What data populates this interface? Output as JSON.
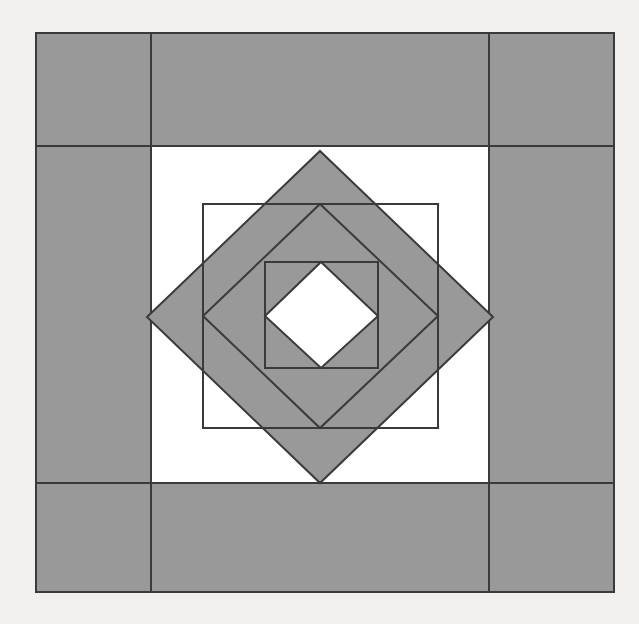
{
  "figure": {
    "canvas": {
      "width": 639,
      "height": 624
    },
    "colors": {
      "background": "#f2f0ee",
      "shape_fill": "#999999",
      "negative_fill": "#ffffff",
      "stroke": "#3a3a3a"
    },
    "stroke_width": 2,
    "frame": {
      "label": "outer border frame",
      "x": 36,
      "y": 33,
      "width": 578,
      "height": 559,
      "inner_x": 151,
      "inner_y": 146,
      "inner_width": 338,
      "inner_height": 337,
      "corner_seam_lines": [
        {
          "name": "top-left-vertical-seam",
          "x1": 151,
          "y1": 33,
          "x2": 151,
          "y2": 146
        },
        {
          "name": "top-right-vertical-seam",
          "x1": 489,
          "y1": 33,
          "x2": 489,
          "y2": 146
        },
        {
          "name": "bottom-left-vertical-seam",
          "x1": 151,
          "y1": 483,
          "x2": 151,
          "y2": 592
        },
        {
          "name": "bottom-right-vertical-seam",
          "x1": 489,
          "y1": 483,
          "x2": 489,
          "y2": 592
        },
        {
          "name": "left-top-horizontal-seam",
          "x1": 36,
          "y1": 146,
          "x2": 151,
          "y2": 146
        },
        {
          "name": "right-top-horizontal-seam",
          "x1": 489,
          "y1": 146,
          "x2": 614,
          "y2": 146
        },
        {
          "name": "left-bottom-horizontal-seam",
          "x1": 36,
          "y1": 483,
          "x2": 151,
          "y2": 483
        },
        {
          "name": "right-bottom-horizontal-seam",
          "x1": 489,
          "y1": 483,
          "x2": 614,
          "y2": 483
        }
      ]
    },
    "center": {
      "x": 320,
      "y": 317
    },
    "rings": [
      {
        "name": "diamond-1",
        "type": "diamond",
        "fill": "#999999",
        "points": "320,151 493,317 320,483 147,317"
      },
      {
        "name": "square-1",
        "type": "square",
        "fill": "none",
        "points": "203,204 438,204 438,428 203,428"
      },
      {
        "name": "diamond-2",
        "type": "diamond",
        "fill": "none",
        "points": "320,204 438,316 320,428 203,316"
      },
      {
        "name": "square-2",
        "type": "square",
        "fill": "none",
        "points": "265,262 378,262 378,368 265,368"
      },
      {
        "name": "diamond-3",
        "type": "diamond",
        "fill": "#ffffff",
        "points": "321,262 378,316 321,368 265,316"
      }
    ]
  }
}
